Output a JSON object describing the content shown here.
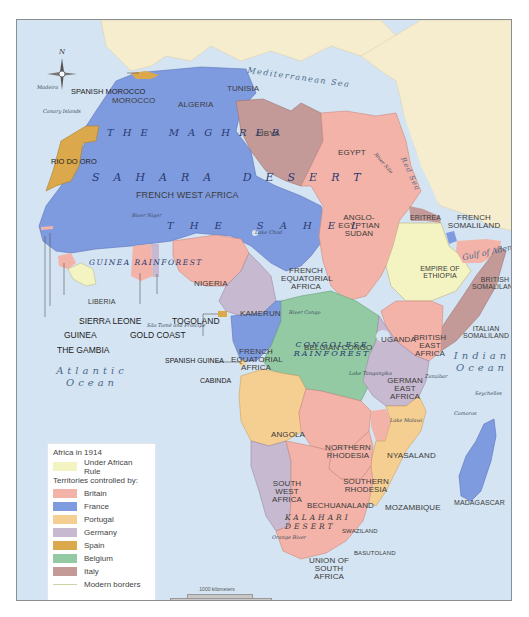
{
  "map": {
    "title": "Africa in 1914",
    "compass": {
      "label": "N"
    },
    "colors": {
      "ocean": "#d4e4f2",
      "outside_land": "#f6edcf",
      "under_african_rule": "#f4f3c2",
      "britain": "#f4b3a8",
      "france": "#7f9be0",
      "portugal": "#f5cf92",
      "germany": "#c7b9cf",
      "spain": "#dba84c",
      "belgium": "#93caa4",
      "italy": "#c39a98",
      "modern_borders": "#c9d4a9"
    },
    "legend": {
      "title": "Africa in 1914",
      "under_african_rule": "Under African Rule",
      "subtitle": "Territories controlled by:",
      "items": [
        {
          "label": "Britain",
          "color": "#f4b3a8"
        },
        {
          "label": "France",
          "color": "#7f9be0"
        },
        {
          "label": "Portugal",
          "color": "#f5cf92"
        },
        {
          "label": "Germany",
          "color": "#c7b9cf"
        },
        {
          "label": "Spain",
          "color": "#dba84c"
        },
        {
          "label": "Belgium",
          "color": "#93caa4"
        },
        {
          "label": "Italy",
          "color": "#c39a98"
        }
      ],
      "modern_borders": "Modern borders"
    },
    "scale": {
      "km": "1000 kilometers",
      "miles": "1000 miles"
    },
    "territories": {
      "spanish_morocco": "SPANISH MOROCCO",
      "morocco": "MOROCCO",
      "algeria": "ALGERIA",
      "tunisia": "TUNISIA",
      "libya": "LIBYA",
      "egypt": "EGYPT",
      "rio_do_oro": "RIO DO ORO",
      "french_west_africa": "FRENCH WEST AFRICA",
      "anglo_egyptian_sudan": "ANGLO-EGYPTIAN SUDAN",
      "eritrea": "ERITREA",
      "french_somaliland": "FRENCH SOMALILAND",
      "british_somaliland": "BRITISH SOMALILAND",
      "ethiopia": "EMPIRE OF ETHIOPIA",
      "italian_somaliland": "ITALIAN SOMALILAND",
      "nigeria": "NIGERIA",
      "french_equatorial_africa_n": "FRENCH EQUATORIAL AFRICA",
      "french_equatorial_africa_s": "FRENCH EQUATORIAL AFRICA",
      "kamerun": "KAMERUN",
      "liberia": "LIBERIA",
      "sierra_leone": "SIERRA LEONE",
      "guinea": "GUINEA",
      "the_gambia": "THE GAMBIA",
      "gold_coast": "GOLD COAST",
      "togoland": "TOGOLAND",
      "spanish_guinea": "SPANISH GUINEA",
      "cabinda": "CABINDA",
      "belgian_congo": "BELGIAN CONGO",
      "uganda": "UGANDA",
      "british_east_africa": "BRITISH EAST AFRICA",
      "german_east_africa": "GERMAN EAST AFRICA",
      "angola": "ANGOLA",
      "northern_rhodesia": "NORTHERN RHODESIA",
      "nyasaland": "NYASALAND",
      "southern_rhodesia": "SOUTHERN RHODESIA",
      "south_west_africa": "SOUTH WEST AFRICA",
      "bechuanaland": "BECHUANALAND",
      "mozambique": "MOZAMBIQUE",
      "swaziland": "SWAZILAND",
      "basutoland": "BASUTOLAND",
      "union_of_south_africa": "UNION OF SOUTH AFRICA",
      "madagascar": "MADAGASCAR"
    },
    "regions": {
      "maghreb": "THE MAGHREB",
      "sahara": "SAHARA DESERT",
      "sahel": "THE SAHEL",
      "guinea_rainforest": "GUINEA RAINFOREST",
      "congolese_rainforest": "CONGOLESE RAINFOREST",
      "kalahari": "KALAHARI DESERT"
    },
    "water": {
      "mediterranean": "Mediterranean Sea",
      "red_sea": "Red Sea",
      "gulf_of_aden": "Gulf of Aden",
      "atlantic_1": "Atlantic",
      "atlantic_2": "Ocean",
      "indian_1": "Indian",
      "indian_2": "Ocean",
      "lake_chad": "Lake Chad",
      "lake_tanganyika": "Lake Tanganyika",
      "lake_malawi": "Lake Malawi",
      "lake_victoria": "Lake Victoria",
      "river_niger": "River Niger",
      "river_congo": "River Congo",
      "river_nile": "River Nile",
      "blue_nile": "Blue Nile",
      "orange_river": "Orange River"
    },
    "islands": {
      "madeira": "Madeira",
      "canary": "Canary Islands",
      "sao_tome": "São Tomé and Príncipe",
      "zanzibar": "Zanzibar",
      "seychelles": "Seychelles",
      "comoros": "Comoros"
    }
  }
}
